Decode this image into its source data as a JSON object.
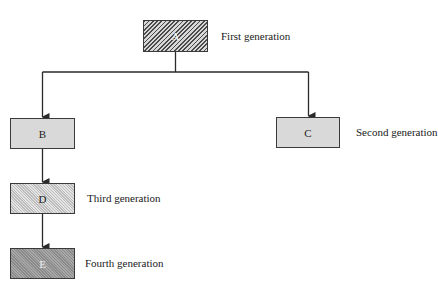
{
  "diagram": {
    "type": "tree",
    "nodes": [
      {
        "id": "A",
        "label": "A",
        "generation": 1,
        "fill": "diagonal-hatch"
      },
      {
        "id": "B",
        "label": "B",
        "generation": 2,
        "fill": "light-gray"
      },
      {
        "id": "C",
        "label": "C",
        "generation": 2,
        "fill": "light-gray"
      },
      {
        "id": "D",
        "label": "D",
        "generation": 3,
        "fill": "fine-stipple"
      },
      {
        "id": "E",
        "label": "E",
        "generation": 4,
        "fill": "dark-stipple"
      }
    ],
    "edges": [
      {
        "from": "A",
        "to": "B"
      },
      {
        "from": "A",
        "to": "C"
      },
      {
        "from": "B",
        "to": "D"
      },
      {
        "from": "D",
        "to": "E"
      }
    ],
    "generation_labels": {
      "first": "First generation",
      "second": "Second generation",
      "third": "Third generation",
      "fourth": "Fourth generation"
    }
  },
  "colors": {
    "line": "#2a2a2a",
    "box_border": "#3a3a3a",
    "light_fill": "#d9d9d9",
    "dark_fill": "#9a9a9a"
  }
}
